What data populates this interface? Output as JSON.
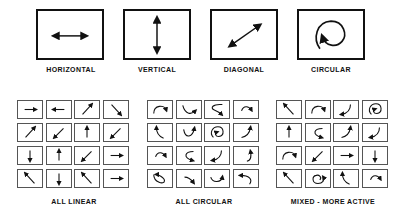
{
  "movement_types": [
    {
      "id": "horizontal",
      "label": "HORIZONTAL",
      "icon": "double-arrow-horizontal-icon"
    },
    {
      "id": "vertical",
      "label": "VERTICAL",
      "icon": "double-arrow-vertical-icon"
    },
    {
      "id": "diagonal",
      "label": "DIAGONAL",
      "icon": "double-arrow-diagonal-icon"
    },
    {
      "id": "circular",
      "label": "CIRCULAR",
      "icon": "circular-arrow-icon"
    }
  ],
  "grids": [
    {
      "id": "all-linear",
      "label": "ALL LINEAR",
      "cells": [
        "right",
        "left",
        "up-right",
        "down-right",
        "up-right",
        "down-left",
        "up",
        "down-left",
        "down",
        "up",
        "down-left",
        "right",
        "up-left",
        "down",
        "up-left",
        "right"
      ]
    },
    {
      "id": "all-circular",
      "label": "ALL CIRCULAR",
      "cells": [
        "arc-over-right",
        "arc-under-right",
        "s-curve-left",
        "arc-over-right-small",
        "arc-up-left",
        "arc-under-up",
        "spiral-loop",
        "arc-up-right",
        "arc-over-right-small",
        "hook-left",
        "arc-down-left",
        "arc-up-right-hook",
        "loop-down-right",
        "arc-down-right-small",
        "arc-under-left",
        "hook-back-left"
      ]
    },
    {
      "id": "mixed-more-active",
      "label": "MIXED - MORE ACTIVE",
      "cells": [
        "up-left",
        "arc-over-right",
        "arc-down-left",
        "spiral-loop",
        "up",
        "hook-left",
        "arc-up-right",
        "arc-down-left",
        "arc-over-right",
        "down-left",
        "right",
        "down",
        "up-left",
        "loop-circle",
        "arc-up-left",
        "arc-over-right-small"
      ]
    }
  ]
}
